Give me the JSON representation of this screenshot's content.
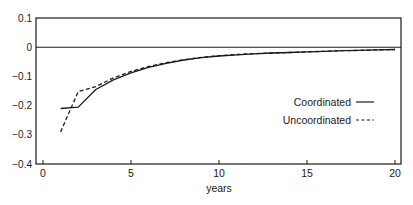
{
  "chart_data": {
    "type": "line",
    "title": "",
    "xlabel": "years",
    "ylabel": "",
    "xlim": [
      -0.4,
      20.3
    ],
    "ylim": [
      -0.4,
      0.1
    ],
    "xticks": [
      0,
      5,
      10,
      15,
      20
    ],
    "xtick_labels": [
      "0",
      "5",
      "10",
      "15",
      "20"
    ],
    "yticks": [
      0.1,
      0,
      -0.1,
      -0.2,
      -0.3,
      -0.4
    ],
    "ytick_labels": [
      "0.1",
      "0",
      "−0.1",
      "−0.2",
      "−0.3",
      "−0.4"
    ],
    "grid": false,
    "reference_line": {
      "y": 0
    },
    "legend_position": "right-middle",
    "x": [
      1,
      2,
      3,
      4,
      5,
      6,
      7,
      8,
      9,
      10,
      11,
      12,
      13,
      14,
      15,
      16,
      17,
      18,
      19,
      20
    ],
    "series": [
      {
        "name": "Coordinated",
        "style": "solid",
        "values": [
          -0.21,
          -0.205,
          -0.145,
          -0.112,
          -0.088,
          -0.069,
          -0.055,
          -0.044,
          -0.036,
          -0.03,
          -0.026,
          -0.023,
          -0.02,
          -0.018,
          -0.016,
          -0.014,
          -0.012,
          -0.011,
          -0.009,
          -0.008
        ]
      },
      {
        "name": "Uncoordinated",
        "style": "dashed",
        "values": [
          -0.29,
          -0.152,
          -0.135,
          -0.105,
          -0.083,
          -0.066,
          -0.053,
          -0.043,
          -0.035,
          -0.029,
          -0.025,
          -0.022,
          -0.02,
          -0.018,
          -0.016,
          -0.014,
          -0.012,
          -0.011,
          -0.009,
          -0.008
        ]
      }
    ]
  },
  "legend": {
    "items": [
      {
        "label": "Coordinated",
        "style": "solid"
      },
      {
        "label": "Uncoordinated",
        "style": "dashed"
      }
    ]
  },
  "colors": {
    "line": "#1a1a1a",
    "background": "#ffffff"
  }
}
